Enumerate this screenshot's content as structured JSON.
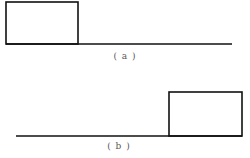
{
  "figure": {
    "panels": [
      {
        "id": "a",
        "caption": "( a )",
        "rectangle": {
          "x": 6,
          "y": 2,
          "width": 72,
          "height": 42
        },
        "baseline": {
          "x1": 6,
          "y": 44,
          "x2": 232
        }
      },
      {
        "id": "b",
        "caption": "( b )",
        "rectangle": {
          "x": 169,
          "y": 92,
          "width": 73,
          "height": 44
        },
        "baseline": {
          "x1": 16,
          "y": 136,
          "x2": 242
        }
      }
    ],
    "stroke_color": "#111111"
  }
}
